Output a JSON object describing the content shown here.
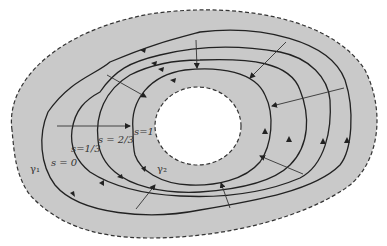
{
  "figure": {
    "colors": {
      "region_fill": "#c9c9c9",
      "curve": "#222222",
      "boundary_dash": "#333333",
      "background": "#ffffff"
    },
    "labels": {
      "gamma1": "γ₁",
      "gamma2": "γ₂",
      "s0": "s = 0",
      "s13": "s=1/3",
      "s23": "s = 2/3",
      "s1": "s=1"
    },
    "curves": [
      {
        "name": "gamma1",
        "param": "s = 0"
      },
      {
        "name": "s-one-third",
        "param": "s = 1/3"
      },
      {
        "name": "s-two-thirds",
        "param": "s = 2/3"
      },
      {
        "name": "gamma2",
        "param": "s = 1"
      }
    ]
  }
}
